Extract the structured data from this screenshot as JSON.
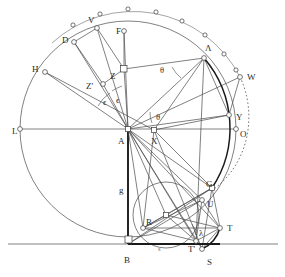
{
  "figure": {
    "background_color": "#ffffff",
    "stroke_color": "#4a4a4a",
    "thick_stroke_color": "#1a1a1a",
    "label_color": "#2b2b2b"
  },
  "labels": [
    {
      "id": "V",
      "text": "V",
      "x": 88,
      "y": 16,
      "kind": "point-label"
    },
    {
      "id": "D",
      "text": "D",
      "x": 62,
      "y": 36,
      "kind": "point-label"
    },
    {
      "id": "F",
      "text": "F",
      "x": 116,
      "y": 27,
      "kind": "point-label"
    },
    {
      "id": "H",
      "text": "H",
      "x": 32,
      "y": 65,
      "kind": "point-label"
    },
    {
      "id": "Lambda",
      "text": "Λ",
      "x": 205,
      "y": 44,
      "kind": "point-label"
    },
    {
      "id": "W",
      "text": "W",
      "x": 247,
      "y": 73,
      "kind": "point-label"
    },
    {
      "id": "Z",
      "text": "Z",
      "x": 110,
      "y": 72,
      "kind": "point-label"
    },
    {
      "id": "Zprime",
      "text": "Z'",
      "x": 86,
      "y": 82,
      "kind": "point-label"
    },
    {
      "id": "Y",
      "text": "Y",
      "x": 236,
      "y": 113,
      "kind": "point-label"
    },
    {
      "id": "L",
      "text": "L",
      "x": 12,
      "y": 127,
      "kind": "point-label"
    },
    {
      "id": "O",
      "text": "O",
      "x": 240,
      "y": 130,
      "kind": "point-label"
    },
    {
      "id": "A",
      "text": "A",
      "x": 118,
      "y": 137,
      "kind": "point-label"
    },
    {
      "id": "X",
      "text": "X",
      "x": 151,
      "y": 137,
      "kind": "point-label"
    },
    {
      "id": "G",
      "text": "G",
      "x": 206,
      "y": 180,
      "kind": "point-label"
    },
    {
      "id": "U",
      "text": "U",
      "x": 207,
      "y": 200,
      "kind": "point-label"
    },
    {
      "id": "R",
      "text": "R",
      "x": 146,
      "y": 218,
      "kind": "point-label"
    },
    {
      "id": "T",
      "text": "T",
      "x": 227,
      "y": 224,
      "kind": "point-label"
    },
    {
      "id": "B",
      "text": "B",
      "x": 124,
      "y": 256,
      "kind": "point-label"
    },
    {
      "id": "Tprime",
      "text": "T'",
      "x": 188,
      "y": 245,
      "kind": "point-label"
    },
    {
      "id": "S",
      "text": "S",
      "x": 207,
      "y": 258,
      "kind": "point-label"
    },
    {
      "id": "g",
      "text": "g",
      "x": 119,
      "y": 186,
      "kind": "segment-label"
    },
    {
      "id": "eps1",
      "text": "ϵ",
      "x": 103,
      "y": 98,
      "kind": "angle-label"
    },
    {
      "id": "eps2",
      "text": "ϵ",
      "x": 116,
      "y": 96,
      "kind": "angle-label"
    },
    {
      "id": "theta1",
      "text": "θ",
      "x": 160,
      "y": 66,
      "kind": "angle-label"
    },
    {
      "id": "theta2",
      "text": "θ",
      "x": 156,
      "y": 113,
      "kind": "angle-label"
    },
    {
      "id": "lambda",
      "text": "λ",
      "x": 199,
      "y": 229,
      "kind": "angle-label"
    },
    {
      "id": "smallmark",
      "text": "s",
      "x": 158,
      "y": 246,
      "kind": "tiny-label"
    }
  ],
  "geometry": {
    "center_A": {
      "x": 128,
      "y": 129
    },
    "main_circle_radius": 108,
    "outer_arc_radius": 120,
    "baseline_y": 244,
    "small_circle": {
      "cx": 166,
      "cy": 215,
      "r": 33
    },
    "points": {
      "L": {
        "x": 20,
        "y": 129
      },
      "O": {
        "x": 236,
        "y": 129
      },
      "B": {
        "x": 128,
        "y": 244
      },
      "H": {
        "x": 45,
        "y": 72
      },
      "D": {
        "x": 74,
        "y": 42
      },
      "V": {
        "x": 97,
        "y": 28
      },
      "F": {
        "x": 124,
        "y": 31
      },
      "Z": {
        "x": 124,
        "y": 69
      },
      "Zprime": {
        "x": 103,
        "y": 84
      },
      "Lambda": {
        "x": 204,
        "y": 58
      },
      "W": {
        "x": 240,
        "y": 77
      },
      "Y": {
        "x": 229,
        "y": 115
      },
      "X": {
        "x": 154,
        "y": 130
      },
      "G": {
        "x": 212,
        "y": 188
      },
      "U": {
        "x": 202,
        "y": 200
      },
      "R": {
        "x": 143,
        "y": 228
      },
      "T": {
        "x": 220,
        "y": 228
      },
      "Tprime": {
        "x": 196,
        "y": 241
      },
      "S": {
        "x": 202,
        "y": 249
      }
    },
    "outer_arc_tick_count": 9,
    "dotted_arc": {
      "from": "W",
      "to": "G"
    }
  }
}
